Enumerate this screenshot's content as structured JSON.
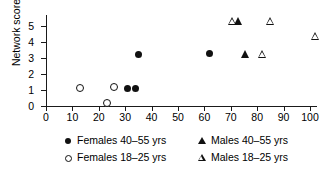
{
  "chart_data": {
    "type": "scatter",
    "title": "",
    "xlabel": "",
    "ylabel": "Network score",
    "xlim": [
      0,
      103
    ],
    "ylim": [
      0,
      5.5
    ],
    "xticks": [
      0,
      10,
      20,
      30,
      40,
      50,
      60,
      70,
      80,
      90,
      100
    ],
    "yticks": [
      0,
      1,
      2,
      3,
      4,
      5
    ],
    "grid": false,
    "legend_position": "below",
    "series": [
      {
        "name": "Females 40–55 yrs",
        "marker": "filled-circle",
        "color": "#111111",
        "points": [
          {
            "x": 31,
            "y": 1.1
          },
          {
            "x": 34,
            "y": 1.1
          },
          {
            "x": 35,
            "y": 3.25
          },
          {
            "x": 62,
            "y": 3.3
          }
        ]
      },
      {
        "name": "Females 18–25 yrs",
        "marker": "open-circle",
        "color": "#111111",
        "points": [
          {
            "x": 12.5,
            "y": 1.15
          },
          {
            "x": 23,
            "y": 0.2
          },
          {
            "x": 25.5,
            "y": 1.2
          }
        ]
      },
      {
        "name": "Males 40–55 yrs",
        "marker": "filled-triangle",
        "color": "#111111",
        "points": [
          {
            "x": 73,
            "y": 5.3
          },
          {
            "x": 75.5,
            "y": 3.25
          }
        ]
      },
      {
        "name": "Males 18–25 yrs",
        "marker": "open-triangle",
        "color": "#111111",
        "points": [
          {
            "x": 70.5,
            "y": 5.3
          },
          {
            "x": 85,
            "y": 5.3
          },
          {
            "x": 82,
            "y": 3.25
          },
          {
            "x": 102,
            "y": 4.4
          }
        ]
      }
    ]
  },
  "legend": {
    "entries": [
      {
        "marker": "filled-circle",
        "label": "Females 40–55 yrs"
      },
      {
        "marker": "open-circle",
        "label": "Females 18–25 yrs"
      },
      {
        "marker": "filled-triangle",
        "label": "Males 40–55 yrs"
      },
      {
        "marker": "open-triangle",
        "label": "Males 18–25 yrs"
      }
    ]
  }
}
